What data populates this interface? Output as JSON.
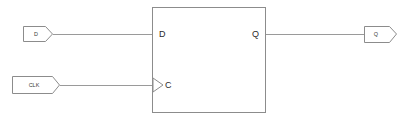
{
  "diagram": {
    "type": "logic-schematic",
    "colors": {
      "background": "#ffffff",
      "wire": "#9a9a9a",
      "outline": "#8c8c8c",
      "text": "#2b2b2b"
    },
    "input_ports": [
      {
        "id": "port-d",
        "label": "D",
        "x": 23,
        "y": 26,
        "width": 30,
        "height": 16
      },
      {
        "id": "port-clk",
        "label": "CLK",
        "x": 12,
        "y": 76,
        "width": 48,
        "height": 18
      }
    ],
    "output_ports": [
      {
        "id": "port-q-out",
        "label": "Q",
        "x": 364,
        "y": 26,
        "width": 33,
        "height": 17
      }
    ],
    "block": {
      "name": "dff-block",
      "x": 152,
      "y": 7,
      "width": 114,
      "height": 106,
      "pins": {
        "data_in": "D",
        "clock_in": "C",
        "data_out": "Q"
      },
      "clock_edge_marker": "triangle"
    },
    "wires": [
      {
        "name": "wire-d",
        "from": "port-d",
        "to": "block.D",
        "y": 34
      },
      {
        "name": "wire-clk",
        "from": "port-clk",
        "to": "block.C",
        "y": 85
      },
      {
        "name": "wire-q",
        "from": "block.Q",
        "to": "port-q-out",
        "y": 34
      }
    ]
  }
}
